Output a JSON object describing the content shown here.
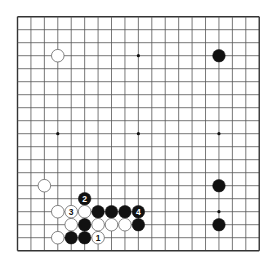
{
  "diagram": {
    "type": "go-board",
    "size": 19,
    "origin": {
      "x": 17.5,
      "y": 16.7
    },
    "spacing": {
      "x": 13.43,
      "y": 13.0
    },
    "stone_radius": 6.3,
    "colors": {
      "line": "#555555",
      "edge": "#333333",
      "black_stone": "#111111",
      "white_stone": "#ffffff",
      "white_stone_border": "#666666",
      "hoshi": "#111111"
    },
    "hoshi": [
      [
        3,
        3
      ],
      [
        9,
        3
      ],
      [
        15,
        3
      ],
      [
        3,
        9
      ],
      [
        9,
        9
      ],
      [
        15,
        9
      ],
      [
        3,
        15
      ],
      [
        9,
        15
      ],
      [
        15,
        15
      ]
    ],
    "stones": [
      {
        "color": "white",
        "col": 3,
        "row": 3,
        "label": ""
      },
      {
        "color": "black",
        "col": 15,
        "row": 3,
        "label": ""
      },
      {
        "color": "black",
        "col": 15,
        "row": 13,
        "label": ""
      },
      {
        "color": "black",
        "col": 15,
        "row": 16,
        "label": ""
      },
      {
        "color": "white",
        "col": 2,
        "row": 13,
        "label": ""
      },
      {
        "color": "black",
        "col": 5,
        "row": 14,
        "label": "2"
      },
      {
        "color": "white",
        "col": 3,
        "row": 15,
        "label": ""
      },
      {
        "color": "white",
        "col": 4,
        "row": 15,
        "label": "3"
      },
      {
        "color": "white",
        "col": 5,
        "row": 15,
        "label": ""
      },
      {
        "color": "black",
        "col": 6,
        "row": 15,
        "label": ""
      },
      {
        "color": "black",
        "col": 7,
        "row": 15,
        "label": ""
      },
      {
        "color": "black",
        "col": 8,
        "row": 15,
        "label": ""
      },
      {
        "color": "black",
        "col": 9,
        "row": 15,
        "label": "4"
      },
      {
        "color": "white",
        "col": 4,
        "row": 16,
        "label": ""
      },
      {
        "color": "black",
        "col": 5,
        "row": 16,
        "label": ""
      },
      {
        "color": "white",
        "col": 6,
        "row": 16,
        "label": ""
      },
      {
        "color": "white",
        "col": 7,
        "row": 16,
        "label": ""
      },
      {
        "color": "white",
        "col": 8,
        "row": 16,
        "label": ""
      },
      {
        "color": "black",
        "col": 9,
        "row": 16,
        "label": ""
      },
      {
        "color": "white",
        "col": 3,
        "row": 17,
        "label": ""
      },
      {
        "color": "black",
        "col": 4,
        "row": 17,
        "label": ""
      },
      {
        "color": "black",
        "col": 5,
        "row": 17,
        "label": ""
      },
      {
        "color": "white",
        "col": 6,
        "row": 17,
        "label": "1"
      }
    ]
  }
}
